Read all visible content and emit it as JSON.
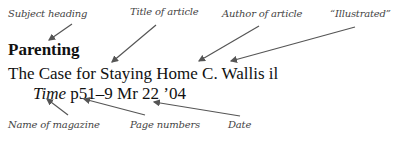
{
  "annotations_top": [
    {
      "id": "subject",
      "text": "Subject heading"
    },
    {
      "id": "title",
      "text": "Title of article"
    },
    {
      "id": "author",
      "text": "Author of article"
    },
    {
      "id": "illustrated",
      "text": "“Illustrated”"
    }
  ],
  "entry": {
    "subject_heading": "Parenting",
    "article_title": "The Case for Staying Home",
    "author": "C. Wallis",
    "illustrated_abbrev": "il",
    "magazine": "Time",
    "pages": "p51–9",
    "date": "Mr 22 ’04"
  },
  "annotations_bottom": [
    {
      "id": "magazine",
      "text": "Name of magazine"
    },
    {
      "id": "pages",
      "text": "Page numbers"
    },
    {
      "id": "date",
      "text": "Date"
    }
  ],
  "colors": {
    "arrow": "#555555",
    "label": "#444444",
    "text": "#111111"
  }
}
